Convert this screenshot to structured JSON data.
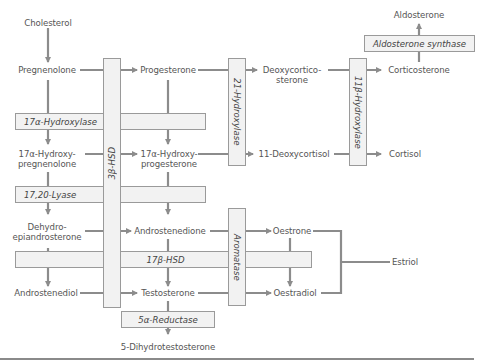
{
  "diagram": {
    "title": "",
    "line_color": "#8c8c8c",
    "enzyme_box_fill": "#f2f2f2",
    "enzyme_box_border": "#9a9a9a",
    "metabolites": {
      "cholesterol": "Cholesterol",
      "pregnenolone": "Pregnenolone",
      "progesterone": "Progesterone",
      "deoxycorticosterone_1": "Deoxycortico-",
      "deoxycorticosterone_2": "sterone",
      "corticosterone": "Corticosterone",
      "aldosterone": "Aldosterone",
      "hydroxypregnenolone_1": "17α-Hydroxy-",
      "hydroxypregnenolone_2": "pregnenolone",
      "hydroxyprogesterone_1": "17α-Hydroxy-",
      "hydroxyprogesterone_2": "progesterone",
      "deoxycortisol": "11-Deoxycortisol",
      "cortisol": "Cortisol",
      "dhea_1": "Dehydro-",
      "dhea_2": "epiandrosterone",
      "androstenedione": "Androstenedione",
      "oestrone": "Oestrone",
      "estriol": "Estriol",
      "androstenediol": "Androstenediol",
      "testosterone": "Testosterone",
      "oestradiol": "Oestradiol",
      "dht": "5-Dihydrotestosterone"
    },
    "enzymes": {
      "hydroxylase_17a": "17α-Hydroxylase",
      "lyase_1720": "17,20-Lyase",
      "hsd_3b": "3β-HSD",
      "hydroxylase_21": "21-Hydroxylase",
      "hydroxylase_11b": "11β-Hydroxylase",
      "aldosterone_synthase": "Aldosterone synthase",
      "hsd_17b": "17β-HSD",
      "aromatase": "Aromatase",
      "reductase_5a": "5α-Reductase"
    }
  }
}
